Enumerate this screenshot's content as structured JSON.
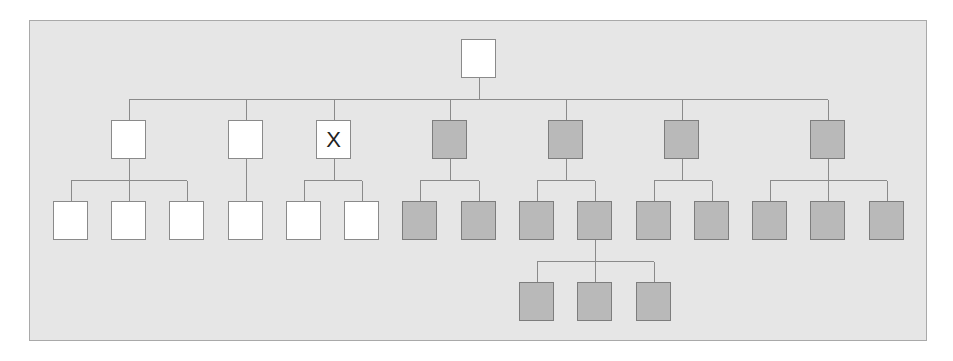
{
  "diagram": {
    "type": "hierarchy-tree",
    "colors": {
      "background": "#e6e6e6",
      "frame_border": "#a9a9a9",
      "white_node": "#ffffff",
      "gray_node": "#b9b9b9",
      "connector": "#8a8a8a"
    },
    "node_size": {
      "w": 35,
      "h": 39
    },
    "nodes": [
      {
        "id": "root",
        "x": 461,
        "y": 39,
        "fill": "white",
        "label": ""
      },
      {
        "id": "a",
        "x": 111,
        "y": 120,
        "fill": "white",
        "label": "",
        "parent": "root"
      },
      {
        "id": "b",
        "x": 228,
        "y": 120,
        "fill": "white",
        "label": "",
        "parent": "root"
      },
      {
        "id": "c",
        "x": 316,
        "y": 120,
        "fill": "white",
        "label": "X",
        "parent": "root"
      },
      {
        "id": "d",
        "x": 432,
        "y": 120,
        "fill": "gray",
        "label": "",
        "parent": "root"
      },
      {
        "id": "e",
        "x": 548,
        "y": 120,
        "fill": "gray",
        "label": "",
        "parent": "root"
      },
      {
        "id": "f",
        "x": 664,
        "y": 120,
        "fill": "gray",
        "label": "",
        "parent": "root"
      },
      {
        "id": "g",
        "x": 810,
        "y": 120,
        "fill": "gray",
        "label": "",
        "parent": "root"
      },
      {
        "id": "a1",
        "x": 53,
        "y": 201,
        "fill": "white",
        "label": "",
        "parent": "a"
      },
      {
        "id": "a2",
        "x": 111,
        "y": 201,
        "fill": "white",
        "label": "",
        "parent": "a"
      },
      {
        "id": "a3",
        "x": 169,
        "y": 201,
        "fill": "white",
        "label": "",
        "parent": "a"
      },
      {
        "id": "b1",
        "x": 228,
        "y": 201,
        "fill": "white",
        "label": "",
        "parent": "b"
      },
      {
        "id": "c1",
        "x": 286,
        "y": 201,
        "fill": "white",
        "label": "",
        "parent": "c"
      },
      {
        "id": "c2",
        "x": 344,
        "y": 201,
        "fill": "white",
        "label": "",
        "parent": "c"
      },
      {
        "id": "d1",
        "x": 402,
        "y": 201,
        "fill": "gray",
        "label": "",
        "parent": "d"
      },
      {
        "id": "d2",
        "x": 461,
        "y": 201,
        "fill": "gray",
        "label": "",
        "parent": "d"
      },
      {
        "id": "e1",
        "x": 519,
        "y": 201,
        "fill": "gray",
        "label": "",
        "parent": "e"
      },
      {
        "id": "e2",
        "x": 577,
        "y": 201,
        "fill": "gray",
        "label": "",
        "parent": "e"
      },
      {
        "id": "f1",
        "x": 636,
        "y": 201,
        "fill": "gray",
        "label": "",
        "parent": "f"
      },
      {
        "id": "f2",
        "x": 694,
        "y": 201,
        "fill": "gray",
        "label": "",
        "parent": "f"
      },
      {
        "id": "g1",
        "x": 752,
        "y": 201,
        "fill": "gray",
        "label": "",
        "parent": "g"
      },
      {
        "id": "g2",
        "x": 810,
        "y": 201,
        "fill": "gray",
        "label": "",
        "parent": "g"
      },
      {
        "id": "g3",
        "x": 869,
        "y": 201,
        "fill": "gray",
        "label": "",
        "parent": "g"
      },
      {
        "id": "e2a",
        "x": 519,
        "y": 282,
        "fill": "gray",
        "label": "",
        "parent": "e2"
      },
      {
        "id": "e2b",
        "x": 577,
        "y": 282,
        "fill": "gray",
        "label": "",
        "parent": "e2"
      },
      {
        "id": "e2c",
        "x": 636,
        "y": 282,
        "fill": "gray",
        "label": "",
        "parent": "e2"
      }
    ]
  }
}
